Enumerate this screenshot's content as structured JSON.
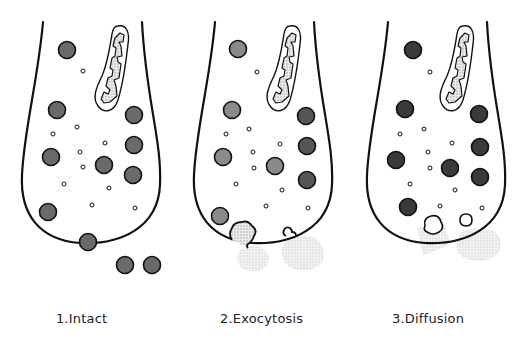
{
  "diagram": {
    "colors": {
      "outline": "#111111",
      "background": "#ffffff",
      "granule_intact": "#6a6a6a",
      "granule_light": "#8a8a8a",
      "granule_dark": "#3a3a3a",
      "stipple": "#cfcfcf",
      "vesicle_fill": "#ffffff"
    },
    "panels": [
      {
        "id": "intact",
        "label": "1.Intact",
        "label_x": 56,
        "offset_x": 0,
        "granule_shade": "granule_intact",
        "granules": [
          [
            67,
            50
          ],
          [
            57,
            110
          ],
          [
            134,
            115
          ],
          [
            51,
            157
          ],
          [
            104,
            165
          ],
          [
            134,
            145
          ],
          [
            133,
            175
          ],
          [
            48,
            212
          ],
          [
            88,
            242
          ],
          [
            125,
            265
          ],
          [
            152,
            265
          ]
        ],
        "vesicles": [
          [
            83,
            71
          ],
          [
            53,
            134
          ],
          [
            77,
            127
          ],
          [
            80,
            152
          ],
          [
            83,
            167
          ],
          [
            64,
            184
          ],
          [
            105,
            143
          ],
          [
            109,
            188
          ],
          [
            92,
            205
          ],
          [
            135,
            208
          ]
        ],
        "release": "none"
      },
      {
        "id": "exocytosis",
        "label": "2.Exocytosis",
        "label_x": 220,
        "offset_x": 172,
        "granule_shade": "granule_light",
        "granules": [
          [
            238,
            49
          ],
          [
            232,
            110
          ],
          [
            306,
            116
          ],
          [
            223,
            157
          ],
          [
            275,
            166
          ],
          [
            307,
            146
          ],
          [
            307,
            180
          ],
          [
            220,
            216
          ]
        ],
        "granules_dark_idx": [
          2,
          5,
          6
        ],
        "vesicles": [
          [
            257,
            72
          ],
          [
            249,
            129
          ],
          [
            226,
            134
          ],
          [
            253,
            152
          ],
          [
            254,
            168
          ],
          [
            236,
            184
          ],
          [
            280,
            144
          ],
          [
            282,
            190
          ],
          [
            266,
            206
          ],
          [
            308,
            208
          ]
        ],
        "release": "exocytosis"
      },
      {
        "id": "diffusion",
        "label": "3.Diffusion",
        "label_x": 392,
        "offset_x": 345,
        "granule_shade": "granule_dark",
        "granules": [
          [
            413,
            50
          ],
          [
            405,
            109
          ],
          [
            479,
            114
          ],
          [
            396,
            160
          ],
          [
            450,
            168
          ],
          [
            480,
            147
          ],
          [
            480,
            177
          ],
          [
            408,
            207
          ]
        ],
        "vesicles": [
          [
            430,
            72
          ],
          [
            424,
            129
          ],
          [
            400,
            134
          ],
          [
            428,
            152
          ],
          [
            430,
            168
          ],
          [
            410,
            184
          ],
          [
            452,
            143
          ],
          [
            455,
            190
          ],
          [
            440,
            206
          ],
          [
            482,
            208
          ]
        ],
        "release": "diffusion"
      }
    ]
  }
}
